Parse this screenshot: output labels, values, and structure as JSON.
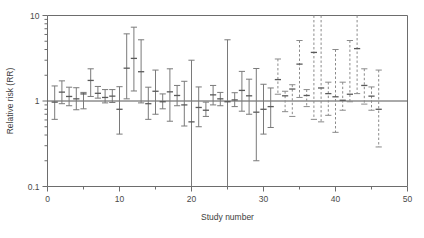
{
  "chart_data": {
    "type": "scatter",
    "plot_kind": "forest-plot",
    "title": "",
    "xlabel": "Study number",
    "ylabel": "Relative risk (RR)",
    "yscale": "log",
    "ylim": [
      0.1,
      10
    ],
    "xlim": [
      0,
      50
    ],
    "y_tick_labels": [
      "0.1",
      "1",
      "10"
    ],
    "y_tick_values": [
      0.1,
      1,
      10
    ],
    "y_minor_ticks": [
      0.2,
      0.3,
      0.4,
      0.5,
      0.6,
      0.7,
      0.8,
      0.9,
      2,
      3,
      4,
      5,
      6,
      7,
      8,
      9
    ],
    "x_tick_labels": [
      "0",
      "10",
      "20",
      "30",
      "40",
      "50"
    ],
    "x_tick_values": [
      0,
      10,
      20,
      30,
      40,
      50
    ],
    "x_minor_ticks": [
      5,
      15,
      25,
      35,
      45
    ],
    "grid": false,
    "legend": null,
    "reference_line": 1,
    "series": [
      {
        "name": "published studies",
        "style": "solid",
        "points": [
          {
            "x": 1,
            "rr": 0.97,
            "lo": 0.61,
            "hi": 1.5
          },
          {
            "x": 2,
            "rr": 1.27,
            "lo": 0.93,
            "hi": 1.72
          },
          {
            "x": 3,
            "rr": 1.13,
            "lo": 0.88,
            "hi": 1.45
          },
          {
            "x": 4,
            "rr": 1.06,
            "lo": 0.79,
            "hi": 1.43
          },
          {
            "x": 5,
            "rr": 1.21,
            "lo": 0.81,
            "hi": 1.26
          },
          {
            "x": 6,
            "rr": 1.74,
            "lo": 1.13,
            "hi": 2.38
          },
          {
            "x": 7,
            "rr": 1.23,
            "lo": 1.08,
            "hi": 1.48
          },
          {
            "x": 8,
            "rr": 1.1,
            "lo": 0.95,
            "hi": 1.36
          },
          {
            "x": 9,
            "rr": 1.14,
            "lo": 0.96,
            "hi": 1.36
          },
          {
            "x": 10,
            "rr": 0.8,
            "lo": 0.41,
            "hi": 1.47
          },
          {
            "x": 11,
            "rr": 2.42,
            "lo": 1.06,
            "hi": 6.1
          },
          {
            "x": 12,
            "rr": 3.15,
            "lo": 1.31,
            "hi": 7.3
          },
          {
            "x": 13,
            "rr": 2.2,
            "lo": 0.95,
            "hi": 5.2
          },
          {
            "x": 14,
            "rr": 0.93,
            "lo": 0.61,
            "hi": 1.45
          },
          {
            "x": 15,
            "rr": 1.3,
            "lo": 0.7,
            "hi": 2.3
          },
          {
            "x": 16,
            "rr": 0.98,
            "lo": 0.81,
            "hi": 1.21
          },
          {
            "x": 17,
            "rr": 1.28,
            "lo": 0.58,
            "hi": 2.38
          },
          {
            "x": 18,
            "rr": 1.16,
            "lo": 0.88,
            "hi": 1.52
          },
          {
            "x": 19,
            "rr": 0.9,
            "lo": 0.51,
            "hi": 1.7
          },
          {
            "x": 20,
            "rr": 0.57,
            "lo": 0.1,
            "hi": 3.0
          },
          {
            "x": 21,
            "rr": 0.84,
            "lo": 0.5,
            "hi": 1.46
          },
          {
            "x": 22,
            "rr": 0.78,
            "lo": 0.66,
            "hi": 0.97
          },
          {
            "x": 23,
            "rr": 1.18,
            "lo": 0.9,
            "hi": 1.52
          },
          {
            "x": 24,
            "rr": 1.06,
            "lo": 0.88,
            "hi": 1.26
          },
          {
            "x": 25,
            "rr": 0.98,
            "lo": 0.1,
            "hi": 5.2
          },
          {
            "x": 26,
            "rr": 1.03,
            "lo": 0.86,
            "hi": 1.25
          },
          {
            "x": 27,
            "rr": 1.33,
            "lo": 0.76,
            "hi": 2.22
          },
          {
            "x": 28,
            "rr": 1.15,
            "lo": 0.7,
            "hi": 1.8
          },
          {
            "x": 29,
            "rr": 0.74,
            "lo": 0.2,
            "hi": 2.4
          },
          {
            "x": 30,
            "rr": 0.8,
            "lo": 0.41,
            "hi": 1.57
          },
          {
            "x": 31,
            "rr": 0.86,
            "lo": 0.49,
            "hi": 1.42
          }
        ]
      },
      {
        "name": "unpublished studies",
        "style": "dashed",
        "points": [
          {
            "x": 32,
            "rr": 1.78,
            "lo": 1.2,
            "hi": 3.1
          },
          {
            "x": 33,
            "rr": 1.15,
            "lo": 0.75,
            "hi": 1.3
          },
          {
            "x": 34,
            "rr": 1.38,
            "lo": 0.66,
            "hi": 1.55
          },
          {
            "x": 35,
            "rr": 2.7,
            "lo": 1.1,
            "hi": 5.1
          },
          {
            "x": 36,
            "rr": 1.16,
            "lo": 0.86,
            "hi": 1.36
          },
          {
            "x": 37,
            "rr": 3.7,
            "lo": 0.61,
            "hi": 10.0
          },
          {
            "x": 38,
            "rr": 1.42,
            "lo": 0.57,
            "hi": 10.0
          },
          {
            "x": 39,
            "rr": 1.22,
            "lo": 0.68,
            "hi": 1.66
          },
          {
            "x": 40,
            "rr": 1.12,
            "lo": 0.43,
            "hi": 4.0
          },
          {
            "x": 41,
            "rr": 1.02,
            "lo": 0.78,
            "hi": 1.66
          },
          {
            "x": 42,
            "rr": 1.2,
            "lo": 0.98,
            "hi": 5.1
          },
          {
            "x": 43,
            "rr": 4.1,
            "lo": 1.22,
            "hi": 10.0
          },
          {
            "x": 44,
            "rr": 1.52,
            "lo": 0.92,
            "hi": 2.38
          },
          {
            "x": 45,
            "rr": 1.14,
            "lo": 0.78,
            "hi": 1.46
          },
          {
            "x": 46,
            "rr": 0.8,
            "lo": 0.29,
            "hi": 2.3
          }
        ]
      }
    ]
  }
}
